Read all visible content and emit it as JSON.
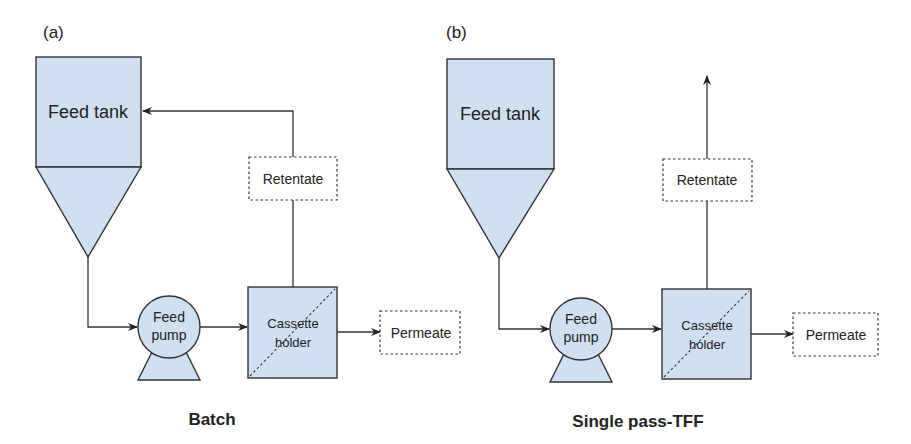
{
  "panels": [
    {
      "letter": "(a)",
      "caption": "Batch",
      "tank": "Feed tank",
      "pump": [
        "Feed",
        "pump"
      ],
      "cassette": [
        "Cassette",
        "holder"
      ],
      "retentate": "Retentate",
      "permeate": "Permeate"
    },
    {
      "letter": "(b)",
      "caption": "Single pass-TFF",
      "tank": "Feed tank",
      "pump": [
        "Feed",
        "pump"
      ],
      "cassette": [
        "Cassette",
        "holder"
      ],
      "retentate": "Retentate",
      "permeate": "Permeate"
    }
  ],
  "colors": {
    "fill": "#cfe0f3",
    "stroke": "#333333"
  }
}
